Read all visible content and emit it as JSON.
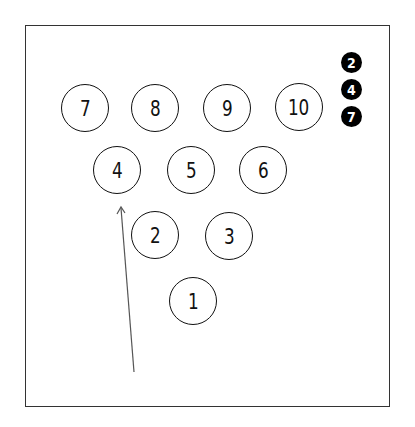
{
  "diagram": {
    "pins": [
      {
        "number": "7",
        "x": 85,
        "y": 108
      },
      {
        "number": "8",
        "x": 155,
        "y": 108
      },
      {
        "number": "9",
        "x": 227,
        "y": 108
      },
      {
        "number": "10",
        "x": 299,
        "y": 107
      },
      {
        "number": "4",
        "x": 117,
        "y": 170
      },
      {
        "number": "5",
        "x": 191,
        "y": 170
      },
      {
        "number": "6",
        "x": 263,
        "y": 170
      },
      {
        "number": "2",
        "x": 155,
        "y": 235
      },
      {
        "number": "3",
        "x": 229,
        "y": 236
      },
      {
        "number": "1",
        "x": 193,
        "y": 301
      }
    ],
    "remaining_pins": [
      "2",
      "4",
      "7"
    ],
    "arrow": {
      "from": [
        134,
        372
      ],
      "to": [
        121,
        207
      ],
      "color": "#555555"
    }
  }
}
